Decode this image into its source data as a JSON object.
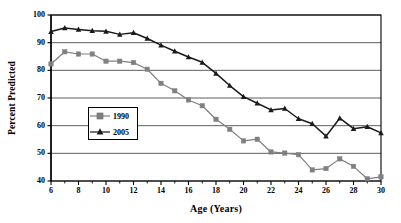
{
  "chart_data": {
    "type": "line",
    "title": "",
    "xlabel": "Age (Years)",
    "ylabel": "Percent Predicted",
    "xlim": [
      6,
      30
    ],
    "ylim": [
      40,
      100
    ],
    "xticks": [
      6,
      8,
      10,
      12,
      14,
      16,
      18,
      20,
      22,
      24,
      26,
      28,
      30
    ],
    "xticks_minor": [
      7,
      9,
      11,
      13,
      15,
      17,
      19,
      21,
      23,
      25,
      27,
      29
    ],
    "yticks": [
      40,
      50,
      60,
      70,
      80,
      90,
      100
    ],
    "grid": "horizontal",
    "legend_position": "inside-left",
    "x": [
      6,
      7,
      8,
      9,
      10,
      11,
      12,
      13,
      14,
      15,
      16,
      17,
      18,
      19,
      20,
      21,
      22,
      23,
      24,
      25,
      26,
      27,
      28,
      29,
      30
    ],
    "series": [
      {
        "name": "1990",
        "color": "#808080",
        "marker": "square",
        "values": [
          82.3,
          86.7,
          85.9,
          85.9,
          83.3,
          83.3,
          82.8,
          80.4,
          75.3,
          72.6,
          69.3,
          67.2,
          62.3,
          58.7,
          54.5,
          55.1,
          50.5,
          50.1,
          49.5,
          44.0,
          44.5,
          48.0,
          45.3,
          40.8,
          41.5
        ]
      },
      {
        "name": "2005",
        "color": "#1a1a1a",
        "marker": "triangle",
        "values": [
          94.0,
          95.3,
          94.8,
          94.3,
          94.1,
          93.0,
          93.6,
          91.5,
          89.1,
          86.9,
          84.8,
          82.9,
          78.9,
          74.5,
          70.5,
          68.1,
          65.7,
          66.2,
          62.5,
          60.7,
          56.2,
          62.7,
          58.9,
          59.6,
          57.4
        ]
      }
    ]
  },
  "axis": {
    "ylabel": "Percent Predicted",
    "xlabel": "Age (Years)",
    "ytick_labels": [
      "100",
      "90",
      "80",
      "70",
      "60",
      "50",
      "40"
    ],
    "xtick_labels": [
      "6",
      "8",
      "10",
      "12",
      "14",
      "16",
      "18",
      "20",
      "22",
      "24",
      "26",
      "28",
      "30"
    ]
  },
  "legend": {
    "entries": [
      {
        "label": "1990",
        "color": "#808080",
        "marker": "square"
      },
      {
        "label": "2005",
        "color": "#1a1a1a",
        "marker": "triangle"
      }
    ]
  },
  "colors": {
    "series_1990": "#808080",
    "series_2005": "#1a1a1a",
    "gridline": "#4d4d4d",
    "axis": "#000000",
    "background": "#ffffff"
  }
}
